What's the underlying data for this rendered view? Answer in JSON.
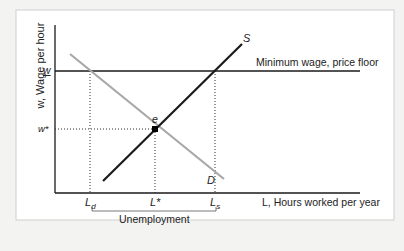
{
  "diagram": {
    "type": "minimum-wage-labor-market",
    "y_axis_label": "w, Wage per hour",
    "x_axis_label": "L, Hours worked per year",
    "price_floor_label": "Minimum wage, price floor",
    "wage_labels": {
      "min_wage": "w",
      "equilibrium_wage": "w*"
    },
    "quantity_labels": {
      "demanded": "L",
      "demanded_sub": "d",
      "equilibrium": "L*",
      "supplied": "L",
      "supplied_sub": "s"
    },
    "curve_labels": {
      "supply": "S",
      "demand": "D",
      "equilibrium_point": "e"
    },
    "bracket_label": "Unemployment",
    "colors": {
      "supply": "#1a1a1a",
      "demand": "#a8a8a8",
      "axes": "#1a1a1a",
      "frame": "#cfcfcf",
      "background": "#ffffff"
    }
  }
}
